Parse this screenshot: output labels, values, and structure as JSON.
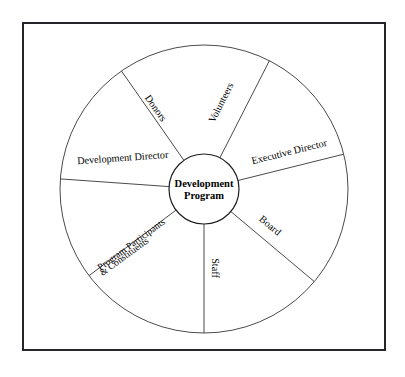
{
  "figure": {
    "kind": "wheel-diagram",
    "border_color": "#26262a",
    "line_color": "#4a4a4f",
    "text_color": "#000000",
    "background_color": "#ffffff"
  },
  "hub": {
    "line1": "Development",
    "line2": "Program"
  },
  "sectors": [
    {
      "id": "volunteers",
      "label": "Volunteers",
      "label2": "",
      "rotation": -63,
      "x": 224,
      "y": 104,
      "anchor": "middle"
    },
    {
      "id": "executive-director",
      "label": "Executive Director",
      "label2": "",
      "rotation": -14,
      "x": 290,
      "y": 155,
      "anchor": "middle"
    },
    {
      "id": "board",
      "label": "Board",
      "label2": "",
      "rotation": 40,
      "x": 268,
      "y": 228,
      "anchor": "middle"
    },
    {
      "id": "staff",
      "label": "Staff",
      "label2": "",
      "rotation": 90,
      "x": 212,
      "y": 268,
      "anchor": "middle"
    },
    {
      "id": "program-participants",
      "label": "Program Participants",
      "label2": "& Constituents",
      "rotation": -36,
      "x": 133,
      "y": 250,
      "anchor": "middle"
    },
    {
      "id": "development-director",
      "label": "Development Director",
      "label2": "",
      "rotation": -4,
      "x": 123,
      "y": 161,
      "anchor": "middle"
    },
    {
      "id": "donors",
      "label": "Donors",
      "label2": "",
      "rotation": 55,
      "x": 153,
      "y": 110,
      "anchor": "middle"
    }
  ],
  "spokes": [
    {
      "id": "spoke-up-right",
      "angle_deg": -63
    },
    {
      "id": "spoke-right-upper",
      "angle_deg": -14
    },
    {
      "id": "spoke-right-lower",
      "angle_deg": 40
    },
    {
      "id": "spoke-down",
      "angle_deg": 90
    },
    {
      "id": "spoke-down-left",
      "angle_deg": 143
    },
    {
      "id": "spoke-left",
      "angle_deg": 184
    },
    {
      "id": "spoke-up-left",
      "angle_deg": 235
    }
  ]
}
